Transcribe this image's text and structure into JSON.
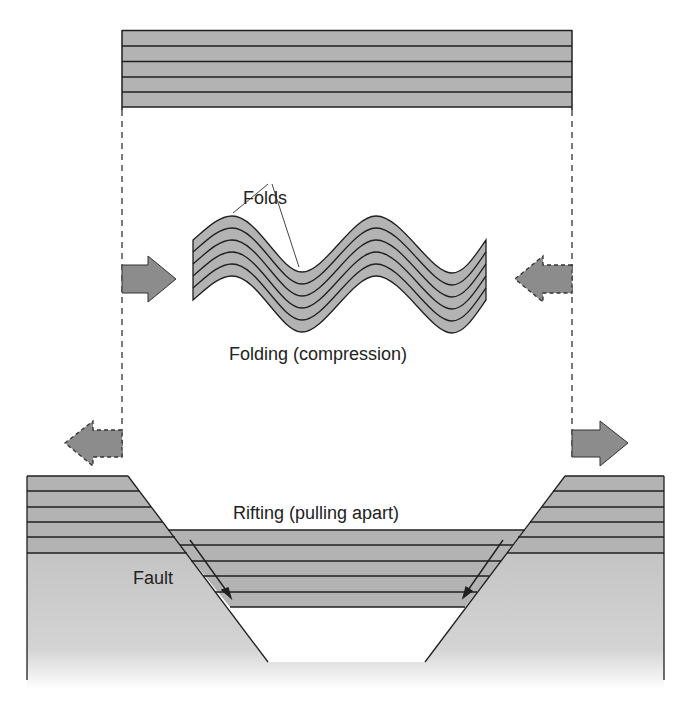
{
  "diagram": {
    "type": "geologic-cross-section",
    "labels": {
      "folds": "Folds",
      "folding_caption": "Folding (compression)",
      "rifting_caption": "Rifting (pulling apart)",
      "fault": "Fault"
    },
    "colors": {
      "layer_fill": "#b3b3b3",
      "basement_fill": "#c8c8c8",
      "layer_line": "#1f1f1f",
      "arrow_fill": "#8c8c8c",
      "guide_line": "#333333"
    },
    "panels": [
      {
        "name": "original-strata",
        "layers": 5
      },
      {
        "name": "folded-strata",
        "layers": 5,
        "process": "compression"
      },
      {
        "name": "rifted-strata",
        "layers": 5,
        "process": "extension"
      }
    ],
    "arrows": [
      {
        "name": "compression-left",
        "direction": "right",
        "style": "solid"
      },
      {
        "name": "compression-right",
        "direction": "left",
        "style": "dashed"
      },
      {
        "name": "extension-left",
        "direction": "left",
        "style": "dashed"
      },
      {
        "name": "extension-right",
        "direction": "right",
        "style": "solid"
      }
    ]
  }
}
